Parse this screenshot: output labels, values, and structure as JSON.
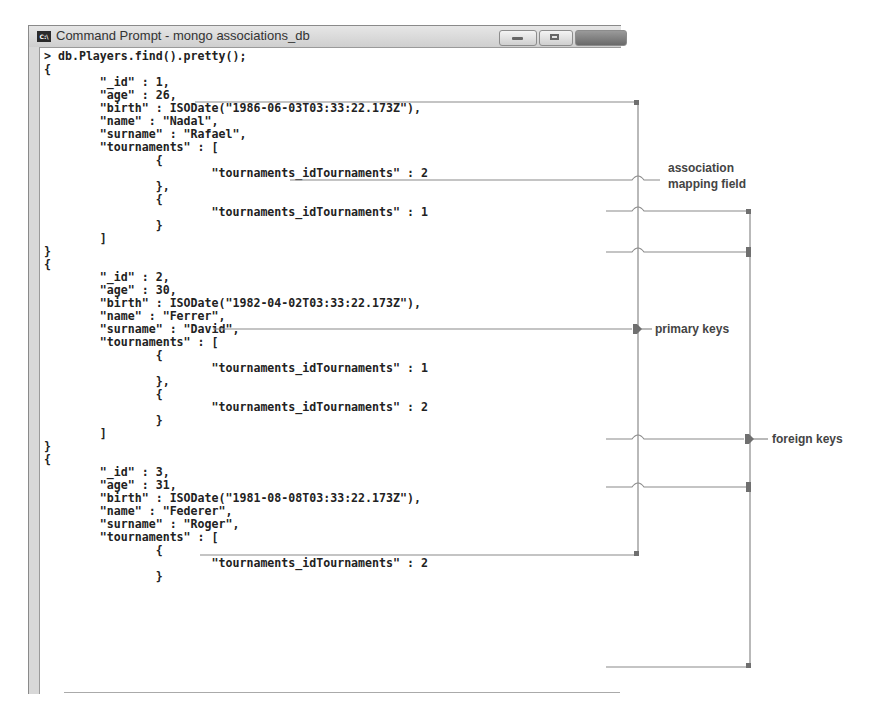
{
  "window": {
    "title": "Command Prompt - mongo  associations_db",
    "icon": "cmd-icon",
    "icon_text": "C:\\",
    "buttons": [
      "minimize",
      "maximize",
      "close"
    ]
  },
  "console": {
    "lines": [
      "> db.Players.find().pretty();",
      "{",
      "        \"_id\" : 1,",
      "        \"age\" : 26,",
      "        \"birth\" : ISODate(\"1986-06-03T03:33:22.173Z\"),",
      "        \"name\" : \"Nadal\",",
      "        \"surname\" : \"Rafael\",",
      "        \"tournaments\" : [",
      "                {",
      "                        \"tournaments_idTournaments\" : 2",
      "                },",
      "                {",
      "                        \"tournaments_idTournaments\" : 1",
      "                }",
      "        ]",
      "}",
      "{",
      "        \"_id\" : 2,",
      "        \"age\" : 30,",
      "        \"birth\" : ISODate(\"1982-04-02T03:33:22.173Z\"),",
      "        \"name\" : \"Ferrer\",",
      "        \"surname\" : \"David\",",
      "        \"tournaments\" : [",
      "                {",
      "                        \"tournaments_idTournaments\" : 1",
      "                },",
      "                {",
      "                        \"tournaments_idTournaments\" : 2",
      "                }",
      "        ]",
      "}",
      "{",
      "        \"_id\" : 3,",
      "        \"age\" : 31,",
      "        \"birth\" : ISODate(\"1981-08-08T03:33:22.173Z\"),",
      "        \"name\" : \"Federer\",",
      "        \"surname\" : \"Roger\",",
      "        \"tournaments\" : [",
      "                {",
      "                        \"tournaments_idTournaments\" : 2",
      "                }"
    ]
  },
  "annotations": {
    "association_mapping_field": [
      "association",
      "mapping field"
    ],
    "primary_keys": "primary keys",
    "foreign_keys": "foreign keys"
  },
  "colors": {
    "connector": "#8a8a8a",
    "connector_marker": "#6f6f6f",
    "label": "#444444",
    "console_bg": "#ffffff",
    "frame": "#d8d8d8"
  }
}
